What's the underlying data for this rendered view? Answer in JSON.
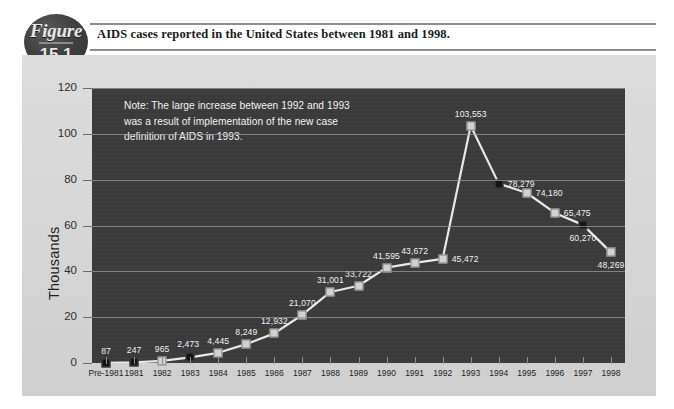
{
  "figure": {
    "badge_word": "Figure",
    "badge_number": "15.1",
    "caption": "AIDS cases reported in the United States between 1981 and 1998."
  },
  "note": "Note:  The large increase between 1992 and 1993\nwas a result of implementation of the new case\ndefinition of AIDS in 1993.",
  "colors": {
    "plot_background": "#3b3b3b",
    "panel_background": "#d6d6d6",
    "line": "#e8e8e8",
    "marker_light": "#d2d2d2",
    "marker_dark": "#141414",
    "gridline": "#9a9a9a",
    "badge": "#3a3a3a",
    "text_dark": "#1f1f1f",
    "text_light": "#f0f0f0"
  },
  "chart_data": {
    "type": "line",
    "title": "AIDS cases reported in the United States between 1981 and 1998.",
    "xlabel": "",
    "ylabel": "Thousands",
    "ylim": [
      0,
      120
    ],
    "yticks": [
      0,
      20,
      40,
      60,
      80,
      100,
      120
    ],
    "ytick_labels": [
      "0",
      "20",
      "40",
      "60",
      "80",
      "100",
      "120"
    ],
    "grid": true,
    "legend": false,
    "annotation": "Note:  The large increase between 1992 and 1993 was a result of implementation of the new case definition of AIDS in 1993.",
    "categories": [
      "Pre-1981",
      "1981",
      "1982",
      "1983",
      "1984",
      "1985",
      "1986",
      "1987",
      "1988",
      "1989",
      "1990",
      "1991",
      "1992",
      "1993",
      "1994",
      "1995",
      "1996",
      "1997",
      "1998"
    ],
    "values": [
      87,
      247,
      965,
      2473,
      4445,
      8249,
      12932,
      21070,
      31001,
      33722,
      41595,
      43672,
      45472,
      103553,
      78279,
      74180,
      65475,
      60270,
      48269
    ],
    "point_labels": [
      "87",
      "247",
      "965",
      "2,473",
      "4,445",
      "8,249",
      "12,932",
      "21,070",
      "31,001",
      "33,722",
      "41,595",
      "43,672",
      "45,472",
      "103,553",
      "78,279",
      "74,180",
      "65,475",
      "60,270",
      "48,269"
    ],
    "marker_styles": [
      "dark",
      "dark",
      "light",
      "dark",
      "light",
      "light",
      "light",
      "light",
      "light",
      "light",
      "light",
      "light",
      "light",
      "light",
      "dark",
      "light",
      "light",
      "dark",
      "light"
    ],
    "label_positions": [
      "above",
      "above",
      "above",
      "above-left",
      "above",
      "above",
      "above",
      "above",
      "above",
      "above",
      "above",
      "above",
      "right",
      "above",
      "right",
      "right",
      "right",
      "below",
      "below"
    ]
  }
}
